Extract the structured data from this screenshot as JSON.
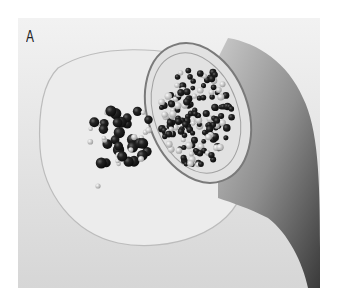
{
  "figure": {
    "panel_label": "A",
    "colors": {
      "background": "#e8e8e8",
      "dark_bead": "#1a1a1a",
      "pearl_bead": "#bdbdbd",
      "skin": "#9a9a9a"
    }
  }
}
